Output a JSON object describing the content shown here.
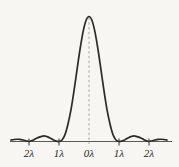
{
  "figure": {
    "name": "single-slit-diffraction-intensity-pattern",
    "background_color": "#f7f6f2",
    "curve_color": "#2e2b27",
    "axis_color": "#5d5a55",
    "center_line_color": "#a9a6a0",
    "label_color": "#2a2722"
  },
  "chart_data": {
    "type": "line",
    "title": "",
    "subtitle": "",
    "xlabel": "",
    "ylabel": "",
    "grid": false,
    "legend": null,
    "xlim": [
      -2.6,
      2.6
    ],
    "ylim": [
      0,
      1.06
    ],
    "axis_units": "wavelengths",
    "tick_labels": [
      "2λ",
      "1λ",
      "0λ",
      "1λ",
      "2λ"
    ],
    "tick_values": [
      -2,
      -1,
      0,
      1,
      2
    ],
    "tick_marks_drawn": [
      -2,
      -1,
      1,
      2
    ],
    "center_dashed_line_at": 0,
    "peak_value": 1.0,
    "peak_position": 0,
    "series": [
      {
        "name": "intensity",
        "x": [
          -2.6,
          -2.5,
          -2.4,
          -2.3,
          -2.2,
          -2.1,
          -2.0,
          -1.9,
          -1.8,
          -1.7,
          -1.6,
          -1.5,
          -1.4,
          -1.3,
          -1.2,
          -1.1,
          -1.0,
          -0.9,
          -0.8,
          -0.7,
          -0.6,
          -0.5,
          -0.4,
          -0.3,
          -0.2,
          -0.1,
          0.0,
          0.1,
          0.2,
          0.3,
          0.4,
          0.5,
          0.6,
          0.7,
          0.8,
          0.9,
          1.0,
          1.1,
          1.2,
          1.3,
          1.4,
          1.5,
          1.6,
          1.7,
          1.8,
          1.9,
          2.0,
          2.1,
          2.2,
          2.3,
          2.4,
          2.5,
          2.6
        ],
        "y": [
          0.012,
          0.016,
          0.018,
          0.017,
          0.012,
          0.006,
          0.0,
          0.007,
          0.019,
          0.031,
          0.039,
          0.045,
          0.039,
          0.028,
          0.014,
          0.004,
          0.0,
          0.012,
          0.055,
          0.14,
          0.255,
          0.405,
          0.573,
          0.736,
          0.875,
          0.968,
          1.0,
          0.968,
          0.875,
          0.736,
          0.573,
          0.405,
          0.255,
          0.14,
          0.055,
          0.012,
          0.0,
          0.004,
          0.014,
          0.028,
          0.039,
          0.045,
          0.039,
          0.031,
          0.019,
          0.007,
          0.0,
          0.006,
          0.012,
          0.017,
          0.018,
          0.016,
          0.012
        ]
      }
    ]
  },
  "labels": [
    {
      "text": "2λ",
      "x_value": -2
    },
    {
      "text": "1λ",
      "x_value": -1
    },
    {
      "text": "0λ",
      "x_value": 0
    },
    {
      "text": "1λ",
      "x_value": 1
    },
    {
      "text": "2λ",
      "x_value": 2
    }
  ]
}
